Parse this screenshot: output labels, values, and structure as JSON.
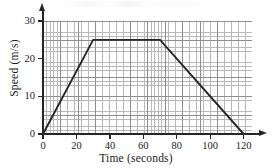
{
  "chart_data": {
    "type": "line",
    "title": "",
    "xlabel": "Time (seconds)",
    "ylabel": "Speed (m/s)",
    "xlim": [
      0,
      125
    ],
    "ylim": [
      0,
      30
    ],
    "grid": true,
    "grid_minor_step_x": 2,
    "grid_minor_step_y": 1,
    "grid_major_step_x": 10,
    "grid_major_step_y": 5,
    "legend": "none",
    "xticks": [
      0,
      20,
      40,
      60,
      80,
      100,
      120
    ],
    "yticks": [
      0,
      10,
      20,
      30
    ],
    "xtick_labels": [
      "0",
      "20",
      "40",
      "60",
      "80",
      "100",
      "120"
    ],
    "ytick_labels": [
      "0",
      "10",
      "20",
      "30"
    ],
    "series": [
      {
        "name": "speed",
        "color": "#262626",
        "x": [
          0,
          30,
          70,
          120
        ],
        "y": [
          0,
          25,
          25,
          0
        ],
        "points": [
          {
            "t": 0,
            "v": 0
          },
          {
            "t": 30,
            "v": 25
          },
          {
            "t": 70,
            "v": 25
          },
          {
            "t": 120,
            "v": 0
          }
        ]
      }
    ],
    "annotations": []
  },
  "axes": {
    "x_title": "Time (seconds)",
    "y_title": "Speed (m/s)"
  },
  "colors": {
    "line": "#262626",
    "axis": "#262626",
    "grid_minor": "#b9b9bd",
    "grid_major": "#8e8e94",
    "background": "#ffffff",
    "text": "#1c1c1c"
  }
}
